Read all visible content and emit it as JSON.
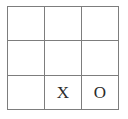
{
  "board": {
    "title": "Tic-Tac-Toe Board",
    "rows": 3,
    "columns": 3,
    "line_color": "#7d7d7d",
    "background_color": "#ffffff",
    "mark_color": "#2b2b2b",
    "cells": [
      {
        "id": "cell-r1c1",
        "row": 1,
        "column": 1,
        "mark": "",
        "state": "empty"
      },
      {
        "id": "cell-r1c2",
        "row": 1,
        "column": 2,
        "mark": "",
        "state": "empty"
      },
      {
        "id": "cell-r1c3",
        "row": 1,
        "column": 3,
        "mark": "",
        "state": "empty"
      },
      {
        "id": "cell-r2c1",
        "row": 2,
        "column": 1,
        "mark": "",
        "state": "empty"
      },
      {
        "id": "cell-r2c2",
        "row": 2,
        "column": 2,
        "mark": "",
        "state": "empty"
      },
      {
        "id": "cell-r2c3",
        "row": 2,
        "column": 3,
        "mark": "",
        "state": "empty"
      },
      {
        "id": "cell-r3c1",
        "row": 3,
        "column": 1,
        "mark": "",
        "state": "empty"
      },
      {
        "id": "cell-r3c2",
        "row": 3,
        "column": 2,
        "mark": "X",
        "state": "filled"
      },
      {
        "id": "cell-r3c3",
        "row": 3,
        "column": 3,
        "mark": "O",
        "state": "filled"
      }
    ]
  }
}
